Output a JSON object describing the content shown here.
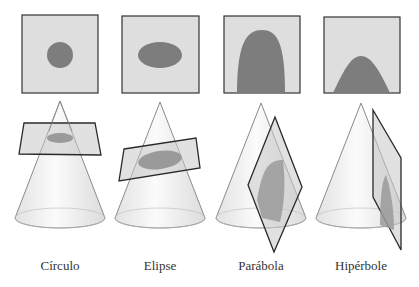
{
  "colors": {
    "background": "#ffffff",
    "square_fill": "#dedede",
    "square_stroke": "#333333",
    "section_fill": "#7d7d7d",
    "cone_fill": "#efefef",
    "cone_stroke": "#8a8a8a",
    "plane_fill": "#c8c8c8",
    "plane_stroke": "#2a2a2a"
  },
  "panels": [
    {
      "id": "circle",
      "label": "Círculo"
    },
    {
      "id": "ellipse",
      "label": "Elipse"
    },
    {
      "id": "parabola",
      "label": "Parábola"
    },
    {
      "id": "hyperbola",
      "label": "Hipérbole"
    }
  ]
}
